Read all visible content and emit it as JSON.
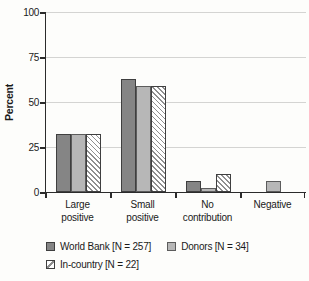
{
  "chart_data": {
    "type": "bar",
    "ylabel": "Percent",
    "ylim": [
      0,
      100
    ],
    "yticks": [
      0,
      25,
      50,
      75,
      100
    ],
    "grid": true,
    "legend_position": "bottom-left",
    "categories": [
      "Large positive",
      "Small positive",
      "No contribution",
      "Negative"
    ],
    "category_lines": [
      [
        "Large",
        "positive"
      ],
      [
        "Small",
        "positive"
      ],
      [
        "No",
        "contribution"
      ],
      [
        "Negative"
      ]
    ],
    "series": [
      {
        "name": "World Bank [N = 257]",
        "values": [
          32,
          63,
          6,
          0
        ],
        "fill": "#858585",
        "border": "#3f3f3f",
        "hatch": false
      },
      {
        "name": "Donors [N = 34]",
        "values": [
          32,
          59,
          2,
          6
        ],
        "fill": "#b7b7b7",
        "border": "#5c5c5c",
        "hatch": false
      },
      {
        "name": "In-country [N = 22]",
        "values": [
          32,
          59,
          10,
          0
        ],
        "fill": "#ffffff",
        "border": "#3f3f3f",
        "hatch": true,
        "hatch_color": "#8f8f8f"
      }
    ],
    "legend_rows": [
      [
        0,
        1
      ],
      [
        2
      ]
    ]
  },
  "colors": {
    "background": "#fdfdfb",
    "grid": "#d4d4d2",
    "axis": "#2b2b2b",
    "text": "#1a1a1a"
  }
}
